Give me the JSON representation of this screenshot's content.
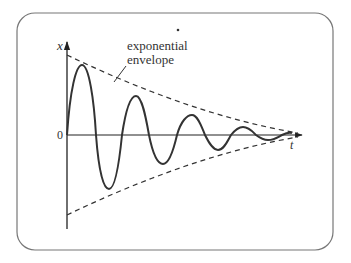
{
  "diagram": {
    "axes": {
      "y_label": "x",
      "x_label": "t",
      "origin_label": "0"
    },
    "annotation": {
      "line1": "exponential",
      "line2": "envelope"
    },
    "colors": {
      "frame": "#777777",
      "curve": "#333333",
      "axis": "#222222",
      "text": "#333333"
    }
  }
}
